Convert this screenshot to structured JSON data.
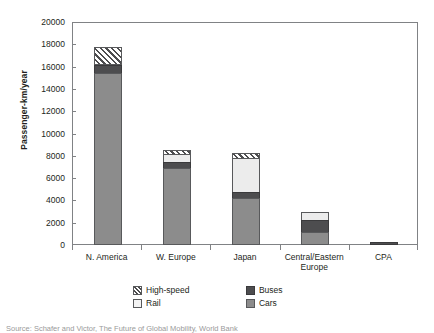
{
  "chart_data": {
    "type": "bar",
    "title": "",
    "xlabel": "",
    "ylabel": "Passenger-km/year",
    "ylim": [
      0,
      20000
    ],
    "ytick_step": 2000,
    "yticks": [
      "20000",
      "18000",
      "16000",
      "14000",
      "12000",
      "10000",
      "8000",
      "6000",
      "4000",
      "2000",
      "0"
    ],
    "grid": false,
    "stacked": true,
    "legend_position": "bottom",
    "categories": [
      "N. America",
      "W. Europe",
      "Japan",
      "Central/Eastern Europe",
      "CPA"
    ],
    "series": [
      {
        "name": "Cars",
        "color": "#8c8c8c",
        "values": [
          15400,
          6950,
          4200,
          1200,
          0
        ]
      },
      {
        "name": "Buses",
        "color": "#4d4d4f",
        "values": [
          800,
          600,
          600,
          1100,
          300
        ]
      },
      {
        "name": "Rail",
        "color": "#ececec",
        "values": [
          150,
          800,
          3200,
          800,
          0
        ]
      },
      {
        "name": "High-speed",
        "color": "hatched",
        "values": [
          1650,
          450,
          500,
          0,
          0
        ]
      }
    ],
    "totals": [
      18000,
      8800,
      8500,
      3100,
      300
    ],
    "legend_entries": [
      "High-speed",
      "Buses",
      "Rail",
      "Cars"
    ]
  },
  "axis": {
    "y_title": "Passenger-km/year"
  },
  "caption": {
    "text": "Source: Schafer and Victor, The Future of Global Mobility, World Bank"
  }
}
